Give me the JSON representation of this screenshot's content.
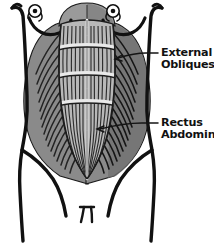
{
  "figure": {
    "style": "hand-drawn black and white anatomical diagram",
    "view": "anterior torso",
    "width": 214,
    "height": 243
  },
  "colors": {
    "background": "#ffffff",
    "outline": "#141414",
    "obliques_fill": "#8a8a8a",
    "obliques_shadow": "#6d6d6d",
    "rectus_fill": "#b8b8b8",
    "rectus_highlight": "#cfcfcf",
    "chest_fill": "#9a9a9a",
    "chest_shadow": "#7b7b7b",
    "striation": "#2a2a2a",
    "label_color": "#111111",
    "leader_color": "#141414"
  },
  "labels": [
    {
      "id": "external-obliques",
      "line1": "External",
      "line2": "Obliques",
      "text_x": 161,
      "line1_y": 56,
      "line2_y": 68,
      "leader": {
        "from_x": 158,
        "from_y": 53,
        "elbow_x": 148,
        "elbow_y": 53,
        "to_x": 112,
        "to_y": 60,
        "arrow": true
      }
    },
    {
      "id": "rectus-abdominis",
      "line1": "Rectus",
      "line2": "Abdominis",
      "text_x": 161,
      "line1_y": 126,
      "line2_y": 138,
      "leader": {
        "from_x": 158,
        "from_y": 123,
        "elbow_x": 143,
        "elbow_y": 123,
        "to_x": 97,
        "to_y": 129,
        "arrow": true
      }
    }
  ],
  "anatomy_parts": [
    {
      "id": "torso-outline",
      "name": "torso-outline",
      "description": "outer body contour, shoulders to thighs"
    },
    {
      "id": "chest",
      "name": "chest-region",
      "description": "upper pectoral dome, dark gray"
    },
    {
      "id": "nipple-left",
      "name": "nipple-left",
      "description": "small circle with center dot"
    },
    {
      "id": "nipple-right",
      "name": "nipple-right",
      "description": "small circle with center dot"
    },
    {
      "id": "breast-crease-left",
      "name": "breast-crease-left",
      "description": "curved arc under left pectoral"
    },
    {
      "id": "breast-crease-right",
      "name": "breast-crease-right",
      "description": "curved arc under right pectoral"
    },
    {
      "id": "external-obliques-left",
      "name": "external-obliques-left",
      "description": "left side muscle with diagonal striations"
    },
    {
      "id": "external-obliques-right",
      "name": "external-obliques-right",
      "description": "right side muscle with diagonal striations"
    },
    {
      "id": "rectus-abdominis",
      "name": "rectus-abdominis",
      "description": "central segmented six-pack column tapering to a V"
    },
    {
      "id": "linea-alba",
      "name": "linea-alba",
      "description": "vertical midline groove"
    },
    {
      "id": "tendinous-bands",
      "name": "tendinous-intersections",
      "description": "three horizontal segment divisions"
    },
    {
      "id": "pubic-mark",
      "name": "pubic-mark",
      "description": "small pi-shaped mark at lower center"
    }
  ],
  "segment_count": 4,
  "striation_counts": {
    "obliques_left": 16,
    "obliques_right": 16,
    "rectus_vertical": 18
  }
}
